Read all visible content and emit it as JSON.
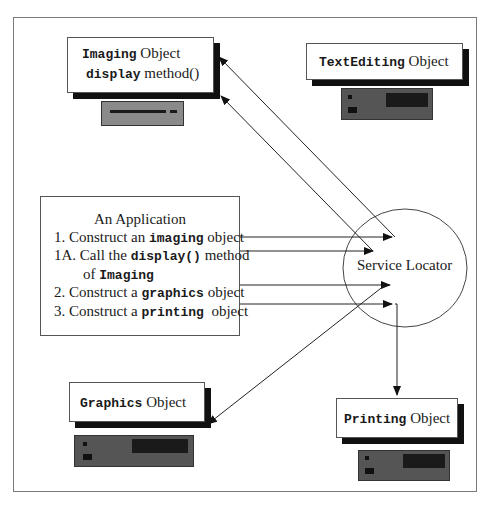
{
  "diagram": {
    "objects": [
      {
        "id": "imaging",
        "name_code": "Imaging",
        "name_text": " Object",
        "line2_code": "display",
        "line2_text": " method()"
      },
      {
        "id": "textediting",
        "name_code": "TextEditing",
        "name_text": " Object"
      },
      {
        "id": "graphics",
        "name_code": "Graphics",
        "name_text": " Object"
      },
      {
        "id": "printing",
        "name_code": "Printing",
        "name_text": " Object"
      }
    ],
    "application": {
      "title": "An Application",
      "steps": [
        {
          "prefix": "1. Construct an ",
          "code": "imaging",
          "suffix": " object"
        },
        {
          "prefix": "1A. Call the ",
          "code": "display()",
          "suffix": " method"
        },
        {
          "prefix": "of ",
          "code": "Imaging",
          "suffix": ""
        },
        {
          "prefix": "2. Construct a ",
          "code": "graphics",
          "suffix": " object"
        },
        {
          "prefix": "3. Construct a ",
          "code": "printing",
          "suffix": "  object"
        }
      ]
    },
    "locator": {
      "label": "Service Locator"
    },
    "colors": {
      "line": "#1a1a1a",
      "device": "#555555",
      "device_light": "#8a8a8a",
      "frame": "#7a7a7a"
    }
  }
}
